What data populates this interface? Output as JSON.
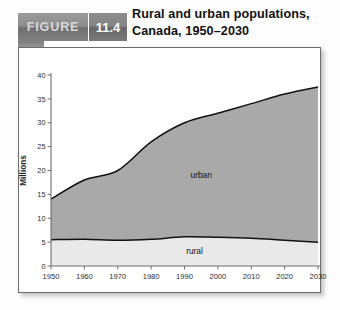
{
  "figure": {
    "badge_word": "FIGURE",
    "badge_number": "11.4",
    "title_line1": "Rural and urban populations,",
    "title_line2": "Canada, 1950–2030"
  },
  "chart_data": {
    "type": "area",
    "stacked": true,
    "title": "Rural and urban populations, Canada, 1950–2030",
    "xlabel": "",
    "ylabel": "Millions",
    "x": [
      1950,
      1960,
      1970,
      1980,
      1990,
      2000,
      2010,
      2020,
      2030
    ],
    "xtick_labels": [
      "1950",
      "1960",
      "1970",
      "1980",
      "1990",
      "2000",
      "2010",
      "2020",
      "2030"
    ],
    "ytick_labels": [
      "0",
      "5",
      "10",
      "15",
      "20",
      "25",
      "30",
      "35",
      "40"
    ],
    "yticks": [
      0,
      5,
      10,
      15,
      20,
      25,
      30,
      35,
      40
    ],
    "xlim": [
      1950,
      2030
    ],
    "ylim": [
      0,
      40
    ],
    "grid": false,
    "legend_position": "inline-annotation",
    "series": [
      {
        "name": "rural",
        "label": "rural",
        "color": "#e9e9e9",
        "values": [
          5.5,
          5.6,
          5.4,
          5.6,
          6.1,
          6.0,
          5.8,
          5.4,
          5.0
        ]
      },
      {
        "name": "urban",
        "label": "urban",
        "color": "#a9a9a9",
        "values": [
          8.5,
          12.4,
          14.6,
          20.4,
          23.9,
          26.0,
          28.2,
          30.6,
          32.5
        ]
      }
    ],
    "cumulative_totals": [
      14.0,
      18.0,
      20.0,
      26.0,
      30.0,
      32.0,
      34.0,
      36.0,
      37.5
    ],
    "annotations": [
      {
        "text": "urban",
        "x": 1995,
        "y": 18.5
      },
      {
        "text": "rural",
        "x": 1993,
        "y": 2.6
      }
    ]
  },
  "colors": {
    "urban_fill": "#a9a9a9",
    "rural_fill": "#e9e9e9",
    "curve_stroke": "#111111",
    "axis": "#6e6e6e",
    "panel_border": "#6d6d6d",
    "badge_text": "#d8d8d8",
    "badge_number_text": "#ffffff"
  }
}
